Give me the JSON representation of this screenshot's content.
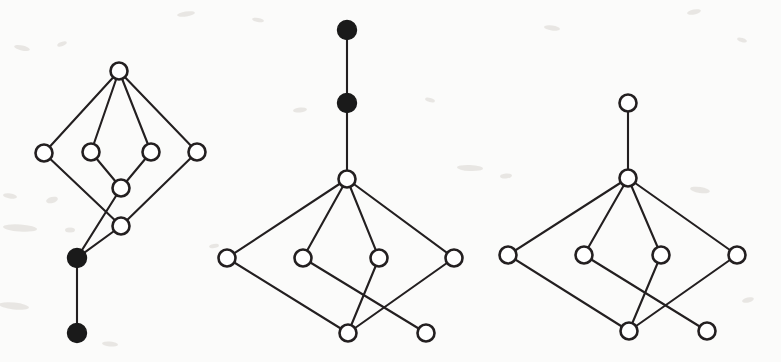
{
  "figure": {
    "background_color": "#fbfbfa",
    "node_stroke_color": "#231f20",
    "edge_color": "#231f20",
    "filled_node_color": "#1a1a1a",
    "open_node_fill": "#ffffff",
    "node_radius": 8.5,
    "filled_node_radius": 9.5,
    "panel_count": 3
  },
  "graphs": [
    {
      "id": "graph-left",
      "label": "Left diagram",
      "node_count": 10,
      "edge_count": 11,
      "filled_node_count": 2,
      "open_node_count": 8,
      "nodes": [
        {
          "id": "L1",
          "x": 119,
          "y": 71,
          "type": "open",
          "label": "left-top"
        },
        {
          "id": "L2",
          "x": 44,
          "y": 153,
          "type": "open",
          "label": "left-row-1"
        },
        {
          "id": "L3",
          "x": 91,
          "y": 152,
          "type": "open",
          "label": "left-row-2"
        },
        {
          "id": "L4",
          "x": 151,
          "y": 152,
          "type": "open",
          "label": "left-row-3"
        },
        {
          "id": "L5",
          "x": 197,
          "y": 152,
          "type": "open",
          "label": "left-row-4"
        },
        {
          "id": "L6",
          "x": 121,
          "y": 188,
          "type": "open",
          "label": "left-mid-upper"
        },
        {
          "id": "L7",
          "x": 121,
          "y": 226,
          "type": "open",
          "label": "left-mid-lower"
        },
        {
          "id": "L8",
          "x": 77,
          "y": 258,
          "type": "filled",
          "label": "left-filled-upper"
        },
        {
          "id": "L9",
          "x": 77,
          "y": 333,
          "type": "filled",
          "label": "left-filled-lower"
        }
      ],
      "edges": [
        {
          "from": "L1",
          "to": "L2"
        },
        {
          "from": "L1",
          "to": "L3"
        },
        {
          "from": "L1",
          "to": "L4"
        },
        {
          "from": "L1",
          "to": "L5"
        },
        {
          "from": "L3",
          "to": "L6"
        },
        {
          "from": "L4",
          "to": "L6"
        },
        {
          "from": "L6",
          "to": "L8"
        },
        {
          "from": "L5",
          "to": "L7"
        },
        {
          "from": "L2",
          "to": "L7"
        },
        {
          "from": "L7",
          "to": "L8"
        },
        {
          "from": "L8",
          "to": "L9"
        }
      ]
    },
    {
      "id": "graph-middle",
      "label": "Middle diagram",
      "node_count": 9,
      "edge_count": 10,
      "filled_node_count": 2,
      "open_node_count": 7,
      "nodes": [
        {
          "id": "M1",
          "x": 347,
          "y": 30,
          "type": "filled",
          "label": "mid-filled-top"
        },
        {
          "id": "M2",
          "x": 347,
          "y": 103,
          "type": "filled",
          "label": "mid-filled-second"
        },
        {
          "id": "M3",
          "x": 347,
          "y": 179,
          "type": "open",
          "label": "mid-hub"
        },
        {
          "id": "M4",
          "x": 227,
          "y": 258,
          "type": "open",
          "label": "mid-row-1"
        },
        {
          "id": "M5",
          "x": 303,
          "y": 258,
          "type": "open",
          "label": "mid-row-2"
        },
        {
          "id": "M6",
          "x": 379,
          "y": 258,
          "type": "open",
          "label": "mid-row-3"
        },
        {
          "id": "M7",
          "x": 454,
          "y": 258,
          "type": "open",
          "label": "mid-row-4"
        },
        {
          "id": "M8",
          "x": 348,
          "y": 333,
          "type": "open",
          "label": "mid-bottom-1"
        },
        {
          "id": "M9",
          "x": 426,
          "y": 333,
          "type": "open",
          "label": "mid-bottom-2"
        }
      ],
      "edges": [
        {
          "from": "M1",
          "to": "M2"
        },
        {
          "from": "M2",
          "to": "M3"
        },
        {
          "from": "M3",
          "to": "M4"
        },
        {
          "from": "M3",
          "to": "M5"
        },
        {
          "from": "M3",
          "to": "M6"
        },
        {
          "from": "M3",
          "to": "M7"
        },
        {
          "from": "M4",
          "to": "M8"
        },
        {
          "from": "M5",
          "to": "M9"
        },
        {
          "from": "M6",
          "to": "M8"
        },
        {
          "from": "M7",
          "to": "M8"
        }
      ]
    },
    {
      "id": "graph-right",
      "label": "Right diagram",
      "node_count": 8,
      "edge_count": 9,
      "filled_node_count": 0,
      "open_node_count": 8,
      "nodes": [
        {
          "id": "R1",
          "x": 628,
          "y": 103,
          "type": "open",
          "label": "right-top"
        },
        {
          "id": "R2",
          "x": 628,
          "y": 178,
          "type": "open",
          "label": "right-hub"
        },
        {
          "id": "R3",
          "x": 508,
          "y": 255,
          "type": "open",
          "label": "right-row-1"
        },
        {
          "id": "R4",
          "x": 584,
          "y": 255,
          "type": "open",
          "label": "right-row-2"
        },
        {
          "id": "R5",
          "x": 661,
          "y": 255,
          "type": "open",
          "label": "right-row-3"
        },
        {
          "id": "R6",
          "x": 737,
          "y": 255,
          "type": "open",
          "label": "right-row-4"
        },
        {
          "id": "R7",
          "x": 629,
          "y": 331,
          "type": "open",
          "label": "right-bottom-1"
        },
        {
          "id": "R8",
          "x": 707,
          "y": 331,
          "type": "open",
          "label": "right-bottom-2"
        }
      ],
      "edges": [
        {
          "from": "R1",
          "to": "R2"
        },
        {
          "from": "R2",
          "to": "R3"
        },
        {
          "from": "R2",
          "to": "R4"
        },
        {
          "from": "R2",
          "to": "R5"
        },
        {
          "from": "R2",
          "to": "R6"
        },
        {
          "from": "R3",
          "to": "R7"
        },
        {
          "from": "R4",
          "to": "R8"
        },
        {
          "from": "R5",
          "to": "R7"
        },
        {
          "from": "R6",
          "to": "R7"
        }
      ]
    }
  ],
  "specks": [
    {
      "x": 22,
      "y": 48,
      "w": 16,
      "h": 5,
      "r": 12
    },
    {
      "x": 62,
      "y": 44,
      "w": 10,
      "h": 4,
      "r": -20
    },
    {
      "x": 10,
      "y": 196,
      "w": 14,
      "h": 5,
      "r": 8
    },
    {
      "x": 52,
      "y": 200,
      "w": 12,
      "h": 6,
      "r": -15
    },
    {
      "x": 20,
      "y": 228,
      "w": 34,
      "h": 7,
      "r": 4
    },
    {
      "x": 70,
      "y": 230,
      "w": 10,
      "h": 5,
      "r": 0
    },
    {
      "x": 14,
      "y": 306,
      "w": 30,
      "h": 7,
      "r": 6
    },
    {
      "x": 186,
      "y": 14,
      "w": 18,
      "h": 5,
      "r": -8
    },
    {
      "x": 258,
      "y": 20,
      "w": 12,
      "h": 4,
      "r": 10
    },
    {
      "x": 300,
      "y": 110,
      "w": 14,
      "h": 5,
      "r": -6
    },
    {
      "x": 430,
      "y": 100,
      "w": 10,
      "h": 4,
      "r": 14
    },
    {
      "x": 470,
      "y": 168,
      "w": 26,
      "h": 6,
      "r": 3
    },
    {
      "x": 214,
      "y": 246,
      "w": 10,
      "h": 4,
      "r": -10
    },
    {
      "x": 552,
      "y": 28,
      "w": 16,
      "h": 5,
      "r": 7
    },
    {
      "x": 694,
      "y": 12,
      "w": 14,
      "h": 5,
      "r": -12
    },
    {
      "x": 742,
      "y": 40,
      "w": 10,
      "h": 4,
      "r": 18
    },
    {
      "x": 506,
      "y": 176,
      "w": 12,
      "h": 5,
      "r": -5
    },
    {
      "x": 700,
      "y": 190,
      "w": 20,
      "h": 6,
      "r": 9
    },
    {
      "x": 748,
      "y": 300,
      "w": 12,
      "h": 5,
      "r": -14
    },
    {
      "x": 110,
      "y": 344,
      "w": 16,
      "h": 5,
      "r": 5
    }
  ]
}
